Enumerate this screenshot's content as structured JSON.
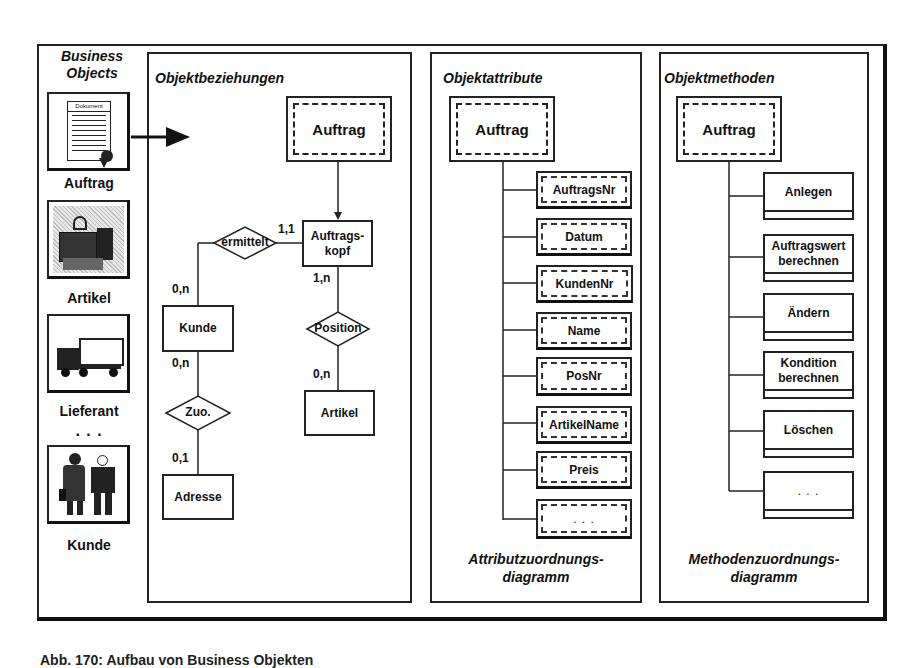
{
  "business_objects": {
    "title_line1": "Business",
    "title_line2": "Objects",
    "items": [
      {
        "label": "Auftrag",
        "icon": "document-icon",
        "icon_text": "Dokument"
      },
      {
        "label": "Artikel",
        "icon": "packages-icon"
      },
      {
        "label": "Lieferant",
        "icon": "truck-icon"
      },
      {
        "label": "Kunde",
        "icon": "people-icon"
      }
    ],
    "ellipsis": ". . ."
  },
  "objektbeziehungen": {
    "title": "Objektbeziehungen",
    "object": "Auftrag",
    "entities": {
      "auftragskopf_line1": "Auftrags-",
      "auftragskopf_line2": "kopf",
      "kunde": "Kunde",
      "adresse": "Adresse",
      "artikel": "Artikel"
    },
    "relationships": {
      "ermittelt": "ermittelt",
      "position": "Position",
      "zuo": "Zuo."
    },
    "cardinalities": {
      "ermittelt_kopf": "1,1",
      "ermittelt_kunde": "0,n",
      "kopf_position": "1,n",
      "position_artikel": "0,n",
      "kunde_zuo": "0,n",
      "zuo_adresse": "0,1"
    }
  },
  "objektattribute": {
    "title": "Objektattribute",
    "object": "Auftrag",
    "attributes": [
      "AuftragsNr",
      "Datum",
      "KundenNr",
      "Name",
      "PosNr",
      "ArtikelName",
      "Preis",
      ". . ."
    ],
    "caption_line1": "Attributzuordnungs-",
    "caption_line2": "diagramm"
  },
  "objektmethoden": {
    "title": "Objektmethoden",
    "object": "Auftrag",
    "methods": [
      {
        "line1": "Anlegen",
        "line2": ""
      },
      {
        "line1": "Auftragswert",
        "line2": "berechnen"
      },
      {
        "line1": "Ändern",
        "line2": ""
      },
      {
        "line1": "Kondition",
        "line2": "berechnen"
      },
      {
        "line1": "Löschen",
        "line2": ""
      },
      {
        "line1": ". . .",
        "line2": ""
      }
    ],
    "caption_line1": "Methodenzuordnungs-",
    "caption_line2": "diagramm"
  },
  "figure_caption_partial": "Abb. 170: Aufbau von Business Objekten"
}
